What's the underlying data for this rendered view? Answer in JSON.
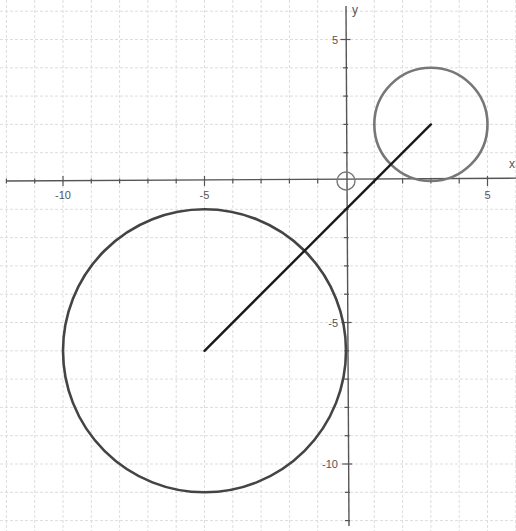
{
  "chart_data": {
    "type": "scatter",
    "title": "",
    "xlabel": "x",
    "ylabel": "y",
    "xlim": [
      -12.2,
      6
    ],
    "ylim": [
      -12,
      6
    ],
    "grid": true,
    "grid_step": 1,
    "x_ticks": [
      -10,
      -5,
      5
    ],
    "y_ticks": [
      5,
      -5,
      -10
    ],
    "x_tick_labels": [
      "-10",
      "-5",
      "5"
    ],
    "y_tick_labels": [
      "5",
      "-5",
      "-10"
    ],
    "shapes": [
      {
        "kind": "circle",
        "name": "small-circle",
        "center": [
          3,
          2
        ],
        "radius": 2,
        "color": "#777777"
      },
      {
        "kind": "circle",
        "name": "large-circle",
        "center": [
          -5,
          -6
        ],
        "radius": 5,
        "color": "#444444"
      },
      {
        "kind": "segment",
        "name": "center-segment",
        "from": [
          -5,
          -6
        ],
        "to": [
          3,
          2
        ],
        "color": "#1a1a1a"
      },
      {
        "kind": "marker",
        "name": "origin-marker",
        "at": [
          0,
          0
        ],
        "radius_px": 9,
        "color": "#777777"
      }
    ]
  },
  "axes": {
    "x_label": "x",
    "y_label": "y"
  },
  "colors": {
    "grid": "#dddddd",
    "axis": "#555555",
    "small_circle": "#777777",
    "large_circle": "#444444",
    "segment": "#1a1a1a"
  }
}
